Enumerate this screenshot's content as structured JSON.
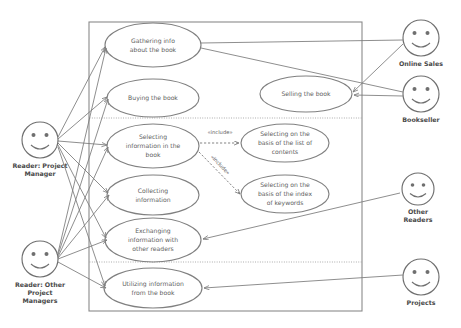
{
  "diagram": {
    "type": "uml-use-case-diagram",
    "stroke_color": "#808080",
    "text_color": "#5e5e5e",
    "background": "#ffffff"
  },
  "system_boundary": {
    "label": ""
  },
  "actors": [
    {
      "id": "reader-project-manager",
      "name": "Reader: Project\nManager",
      "line1": "Reader: Project",
      "line2": "Manager",
      "cx": 40,
      "cy": 140,
      "side": "left"
    },
    {
      "id": "reader-other-project-managers",
      "name": "Reader: Other Project Managers",
      "line1": "Reader: Other",
      "line2": "Project",
      "line3": "Managers",
      "cx": 40,
      "cy": 259,
      "side": "left"
    },
    {
      "id": "online-sales",
      "name": "Online Sales",
      "line1": "Online Sales",
      "cx": 421,
      "cy": 38,
      "side": "right"
    },
    {
      "id": "bookseller",
      "name": "Bookseller",
      "line1": "Bookseller",
      "cx": 421,
      "cy": 94,
      "side": "right"
    },
    {
      "id": "other-readers",
      "name": "Other Readers",
      "line1": "Other",
      "line2": "Readers",
      "cx": 418,
      "cy": 189,
      "side": "right"
    },
    {
      "id": "projects",
      "name": "Projects",
      "line1": "Projects",
      "cx": 421,
      "cy": 277,
      "side": "right"
    }
  ],
  "use_cases": [
    {
      "id": "gathering-info",
      "lines": [
        "Gathering info",
        "about the book"
      ],
      "cx": 153,
      "cy": 45,
      "rx": 48,
      "ry": 22
    },
    {
      "id": "buying-the-book",
      "lines": [
        "Buying the book"
      ],
      "cx": 153,
      "cy": 98,
      "rx": 46,
      "ry": 19
    },
    {
      "id": "selling-the-book",
      "lines": [
        "Selling the book"
      ],
      "cx": 306,
      "cy": 94,
      "rx": 46,
      "ry": 18
    },
    {
      "id": "selecting-information",
      "lines": [
        "Selecting",
        "information in the",
        "book"
      ],
      "cx": 153,
      "cy": 146,
      "rx": 46,
      "ry": 22
    },
    {
      "id": "selecting-list-of-contents",
      "lines": [
        "Selecting on the",
        "basis of the list of",
        "contents"
      ],
      "cx": 285,
      "cy": 143,
      "rx": 44,
      "ry": 19
    },
    {
      "id": "selecting-index-of-keywords",
      "lines": [
        "Selecting on the",
        "basis of the index",
        "of keywords"
      ],
      "cx": 285,
      "cy": 194,
      "rx": 44,
      "ry": 19
    },
    {
      "id": "collecting-information",
      "lines": [
        "Collecting",
        "information"
      ],
      "cx": 153,
      "cy": 195,
      "rx": 46,
      "ry": 20
    },
    {
      "id": "exchanging-information",
      "lines": [
        "Exchanging",
        "information with",
        "other readers"
      ],
      "cx": 153,
      "cy": 240,
      "rx": 48,
      "ry": 22
    },
    {
      "id": "utilizing-information",
      "lines": [
        "Utilizing information",
        "from the book"
      ],
      "cx": 153,
      "cy": 288,
      "rx": 49,
      "ry": 20
    }
  ],
  "include_relationships": [
    {
      "id": "include-list-of-contents",
      "label": "«include»",
      "from": "selecting-information",
      "to": "selecting-list-of-contents",
      "label_x": 220,
      "label_y": 133
    },
    {
      "id": "include-index-of-keywords",
      "label": "«include»",
      "from": "selecting-information",
      "to": "selecting-index-of-keywords",
      "label_x": 219,
      "label_y": 164
    }
  ],
  "associations": [
    {
      "from": "reader-project-manager",
      "to": "gathering-info"
    },
    {
      "from": "reader-project-manager",
      "to": "buying-the-book"
    },
    {
      "from": "reader-project-manager",
      "to": "selecting-information"
    },
    {
      "from": "reader-project-manager",
      "to": "collecting-information"
    },
    {
      "from": "reader-project-manager",
      "to": "exchanging-information"
    },
    {
      "from": "reader-project-manager",
      "to": "utilizing-information"
    },
    {
      "from": "reader-other-project-managers",
      "to": "gathering-info"
    },
    {
      "from": "reader-other-project-managers",
      "to": "buying-the-book"
    },
    {
      "from": "reader-other-project-managers",
      "to": "selecting-information"
    },
    {
      "from": "reader-other-project-managers",
      "to": "collecting-information"
    },
    {
      "from": "reader-other-project-managers",
      "to": "exchanging-information"
    },
    {
      "from": "reader-other-project-managers",
      "to": "utilizing-information"
    },
    {
      "from": "online-sales",
      "to": "gathering-info"
    },
    {
      "from": "online-sales",
      "to": "selling-the-book"
    },
    {
      "from": "bookseller",
      "to": "gathering-info"
    },
    {
      "from": "bookseller",
      "to": "selling-the-book"
    },
    {
      "from": "other-readers",
      "to": "exchanging-information"
    },
    {
      "from": "projects",
      "to": "utilizing-information"
    }
  ]
}
